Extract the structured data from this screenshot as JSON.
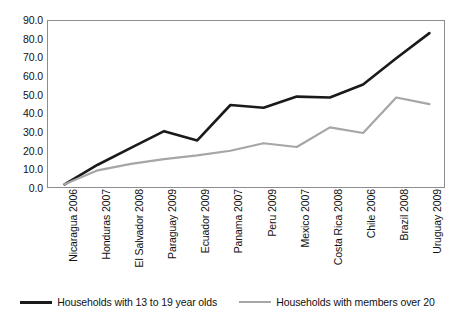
{
  "chart_data": {
    "type": "line",
    "title": "",
    "xlabel": "",
    "ylabel": "",
    "ylim": [
      0.0,
      90.0
    ],
    "ytick_step": 10.0,
    "yticks": [
      "90.0",
      "80.0",
      "70.0",
      "60.0",
      "50.0",
      "40.0",
      "30.0",
      "20.0",
      "10.0",
      "0.0"
    ],
    "grid": false,
    "legend_position": "bottom",
    "categories": [
      "Nicaragua 2006",
      "Honduras 2007",
      "El Salvador 2008",
      "Paraguay 2009",
      "Ecuador 2009",
      "Panama 2007",
      "Peru 2009",
      "Mexico 2007",
      "Costa Rica 2008",
      "Chile 2006",
      "Brazil 2008",
      "Uruguay 2009"
    ],
    "series": [
      {
        "name": "Households with 13 to 19 year olds",
        "color": "#1a1a1a",
        "width": 2.6,
        "values": [
          2.5,
          13.0,
          22.0,
          31.0,
          26.0,
          45.0,
          43.5,
          49.5,
          49.0,
          56.0,
          70.0,
          83.5
        ]
      },
      {
        "name": "Households with members over 20",
        "color": "#a6a6a6",
        "width": 2.2,
        "values": [
          2.5,
          10.0,
          13.5,
          16.0,
          18.0,
          20.5,
          24.5,
          22.5,
          33.0,
          30.0,
          49.0,
          45.5
        ]
      }
    ]
  },
  "legend": {
    "entries": [
      {
        "label": "Households with 13 to 19 year olds",
        "swatch": "dark-line-swatch"
      },
      {
        "label": "Households with members over 20",
        "swatch": "light-line-swatch"
      }
    ]
  },
  "colors": {
    "series_dark": "#1a1a1a",
    "series_light": "#a6a6a6",
    "frame": "#8d8d8d",
    "background": "#ffffff"
  }
}
